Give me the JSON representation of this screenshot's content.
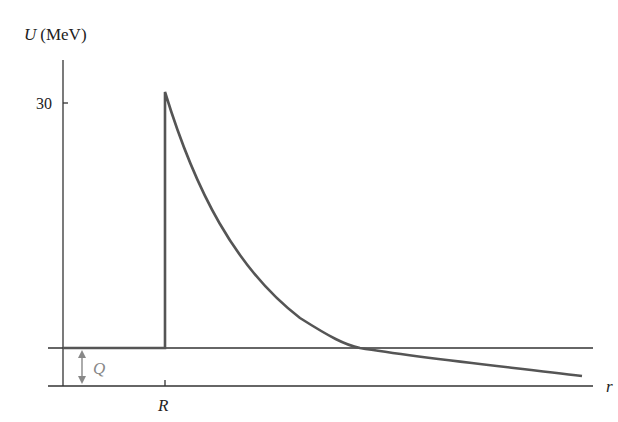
{
  "diagram": {
    "y_axis": {
      "variable": "U",
      "unit": "(MeV)",
      "tick_label": "30"
    },
    "x_axis": {
      "variable": "r",
      "tick_label": "R"
    },
    "annotation": {
      "label": "Q",
      "meaning": "decay energy level above zero"
    },
    "colors": {
      "axes": "#333333",
      "curve": "#555555",
      "annotation": "#888888"
    }
  }
}
